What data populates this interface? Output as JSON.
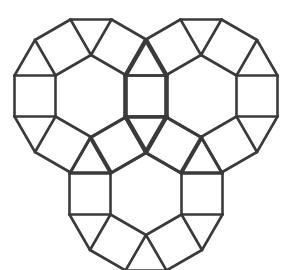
{
  "figure": {
    "stroke_color": "#3a3a3a",
    "background": "#ffffff",
    "stroke_width": 2.6,
    "side": 41,
    "hexagons": [
      {
        "name": "top-left-ring",
        "cx": 91,
        "cy": 96
      },
      {
        "name": "top-right-ring",
        "cx": 201,
        "cy": 96
      },
      {
        "name": "bottom-ring",
        "cx": 146,
        "cy": 194
      }
    ]
  }
}
